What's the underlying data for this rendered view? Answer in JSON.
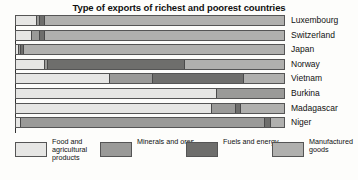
{
  "chart_data": {
    "type": "bar",
    "orientation": "horizontal",
    "stacked": true,
    "normalized": true,
    "title": "Type of exports of richest and poorest countries",
    "xlabel": "",
    "ylabel": "",
    "xlim": [
      0,
      100
    ],
    "grid": false,
    "legend_position": "bottom",
    "categories": [
      "Luxembourg",
      "Switzerland",
      "Japan",
      "Norway",
      "Vietnam",
      "Burkina",
      "Madagascar",
      "Niger"
    ],
    "series": [
      {
        "name": "Food and agricultural products",
        "color": "#e6e6e4",
        "values": [
          8,
          6,
          1,
          11,
          35,
          75,
          73,
          2
        ]
      },
      {
        "name": "Minerals and ores",
        "color": "#9a9a98",
        "values": [
          1,
          3,
          1,
          1,
          16,
          25,
          9,
          91
        ]
      },
      {
        "name": "Fuels and energy",
        "color": "#6e6e6c",
        "values": [
          2,
          2,
          1,
          51,
          34,
          0,
          2,
          2
        ]
      },
      {
        "name": "Manufactured goods",
        "color": "#b0b0ae",
        "values": [
          89,
          89,
          97,
          37,
          15,
          0,
          16,
          5
        ]
      }
    ]
  },
  "legend": {
    "items": [
      {
        "label": "Food and agricultural products",
        "color": "#e6e6e4"
      },
      {
        "label": "Minerals and ores",
        "color": "#9a9a98"
      },
      {
        "label": "Fuels and energy",
        "color": "#6e6e6c"
      },
      {
        "label": "Manufactured goods",
        "color": "#b0b0ae"
      }
    ]
  }
}
